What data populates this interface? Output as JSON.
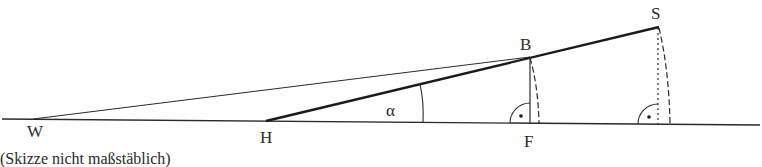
{
  "diagram": {
    "points": {
      "W": {
        "label": "W",
        "x": 33,
        "y": 119
      },
      "H": {
        "label": "H",
        "x": 266,
        "y": 121
      },
      "B": {
        "label": "B",
        "x": 530,
        "y": 57
      },
      "F": {
        "label": "F",
        "x": 530,
        "y": 123
      },
      "S": {
        "label": "S",
        "x": 659,
        "y": 27
      }
    },
    "angle_label": "α",
    "caption": "(Skizze nicht maßstäblich)",
    "colors": {
      "line": "#2a2a2a",
      "background": "#ffffff"
    }
  }
}
